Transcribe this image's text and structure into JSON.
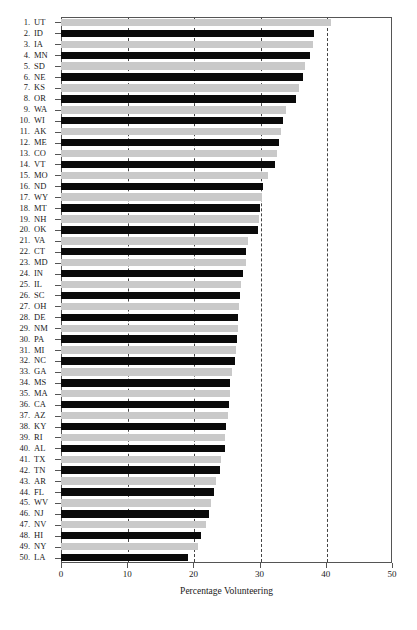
{
  "chart_data": {
    "type": "bar",
    "orientation": "horizontal",
    "title": "",
    "xlabel": "Percentage Volunteering",
    "ylabel": "",
    "xlim": [
      0,
      50
    ],
    "xticks": [
      0,
      10,
      20,
      30,
      40,
      50
    ],
    "xticklabels": [
      "0",
      "10",
      "20",
      "30",
      "40",
      "50"
    ],
    "grid": "vertical-dashed at 10,20,30,40",
    "legend": "none",
    "bar_colors": {
      "odd": "#c9c9c9",
      "even": "#0a0a0a"
    },
    "categories": [
      "UT",
      "ID",
      "IA",
      "MN",
      "SD",
      "NE",
      "KS",
      "OR",
      "WA",
      "WI",
      "AK",
      "ME",
      "CO",
      "VT",
      "MO",
      "ND",
      "WY",
      "MT",
      "NH",
      "OK",
      "VA",
      "CT",
      "MD",
      "IN",
      "IL",
      "SC",
      "OH",
      "DE",
      "NM",
      "PA",
      "MI",
      "NC",
      "GA",
      "MS",
      "MA",
      "CA",
      "AZ",
      "KY",
      "RI",
      "AL",
      "TX",
      "TN",
      "AR",
      "FL",
      "WV",
      "NJ",
      "NV",
      "HI",
      "NY",
      "LA"
    ],
    "ranks": [
      1,
      2,
      3,
      4,
      5,
      6,
      7,
      8,
      9,
      10,
      11,
      12,
      13,
      14,
      15,
      16,
      17,
      18,
      19,
      20,
      21,
      22,
      23,
      24,
      25,
      26,
      27,
      28,
      29,
      30,
      31,
      32,
      33,
      34,
      35,
      36,
      37,
      38,
      39,
      40,
      41,
      42,
      43,
      44,
      45,
      46,
      47,
      48,
      49,
      50
    ],
    "values": [
      40.8,
      38.2,
      38.0,
      37.6,
      36.9,
      36.6,
      35.9,
      35.5,
      34.0,
      33.5,
      33.2,
      32.9,
      32.7,
      32.3,
      31.2,
      30.5,
      30.3,
      30.1,
      29.9,
      29.7,
      28.3,
      28.0,
      27.9,
      27.5,
      27.2,
      27.0,
      26.9,
      26.8,
      26.7,
      26.6,
      26.4,
      26.3,
      25.8,
      25.6,
      25.5,
      25.4,
      25.2,
      24.9,
      24.8,
      24.7,
      24.2,
      24.0,
      23.4,
      23.1,
      22.7,
      22.3,
      21.9,
      21.1,
      20.7,
      19.2
    ]
  },
  "axis": {
    "xtitle": "Percentage Volunteering"
  }
}
